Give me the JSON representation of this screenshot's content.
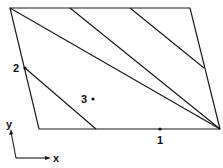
{
  "diagram": {
    "parallelogram": {
      "corners": [
        [
          10,
          8
        ],
        [
          190,
          8
        ],
        [
          220,
          129
        ],
        [
          39,
          129
        ]
      ],
      "stroke": "#1a1a1a"
    },
    "stripes": [
      {
        "from": [
          10,
          8
        ],
        "to": [
          96,
          129
        ]
      },
      {
        "from": [
          10,
          8
        ],
        "to": [
          220,
          129
        ]
      },
      {
        "from": [
          70,
          8
        ],
        "to": [
          220,
          129
        ]
      },
      {
        "from": [
          130,
          8
        ],
        "to": [
          204,
          68
        ]
      }
    ],
    "points": [
      {
        "label": "1",
        "x": 160,
        "y": 129,
        "label_x": 157,
        "label_y": 144
      },
      {
        "label": "2",
        "x": 25,
        "y": 68,
        "label_x": 13,
        "label_y": 72
      },
      {
        "label": "3",
        "x": 93,
        "y": 99,
        "label_x": 81,
        "label_y": 103
      }
    ],
    "axes": {
      "x_label": "x",
      "y_label": "y"
    }
  }
}
